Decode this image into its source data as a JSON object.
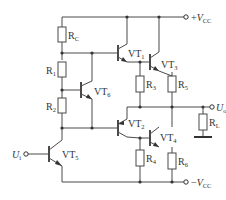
{
  "diagram": {
    "type": "circuit-schematic",
    "supply": {
      "positive": {
        "symbol": "V",
        "sign": "+",
        "subscript": "CC"
      },
      "negative": {
        "symbol": "V",
        "sign": "−",
        "subscript": "CC"
      }
    },
    "input": {
      "symbol": "U",
      "subscript": "i"
    },
    "output": {
      "symbol": "U",
      "subscript": "o"
    },
    "resistors": [
      {
        "id": "RC",
        "name": "R",
        "subscript": "C"
      },
      {
        "id": "R1",
        "name": "R",
        "subscript": "1"
      },
      {
        "id": "R2",
        "name": "R",
        "subscript": "2"
      },
      {
        "id": "R3",
        "name": "R",
        "subscript": "3"
      },
      {
        "id": "R4",
        "name": "R",
        "subscript": "4"
      },
      {
        "id": "R5",
        "name": "R",
        "subscript": "5"
      },
      {
        "id": "R6",
        "name": "R",
        "subscript": "6"
      },
      {
        "id": "RL",
        "name": "R",
        "subscript": "L"
      }
    ],
    "transistors": [
      {
        "id": "VT1",
        "name": "VT",
        "subscript": "1",
        "type": "NPN"
      },
      {
        "id": "VT2",
        "name": "VT",
        "subscript": "2",
        "type": "PNP"
      },
      {
        "id": "VT3",
        "name": "VT",
        "subscript": "3",
        "type": "NPN"
      },
      {
        "id": "VT4",
        "name": "VT",
        "subscript": "4",
        "type": "PNP"
      },
      {
        "id": "VT5",
        "name": "VT",
        "subscript": "5",
        "type": "NPN"
      },
      {
        "id": "VT6",
        "name": "VT",
        "subscript": "6",
        "type": "NPN"
      }
    ]
  }
}
